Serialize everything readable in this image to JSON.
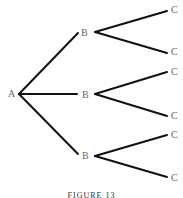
{
  "diagram": {
    "type": "tree",
    "root": {
      "label": "A"
    },
    "level1": [
      {
        "label": "B"
      },
      {
        "label": "B"
      },
      {
        "label": "B"
      }
    ],
    "level2": [
      {
        "label": "C"
      },
      {
        "label": "C"
      },
      {
        "label": "C"
      },
      {
        "label": "C"
      },
      {
        "label": "C"
      },
      {
        "label": "C"
      }
    ],
    "caption": "FIGURE 13",
    "line_color": "#111111",
    "label_color": "#666666"
  }
}
